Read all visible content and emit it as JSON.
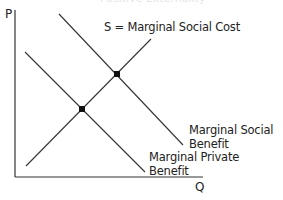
{
  "diagram": {
    "title_faint": "Positive Externality",
    "axes": {
      "y_label": "P",
      "x_label": "Q"
    },
    "curves": [
      {
        "id": "msc",
        "label": "S = Marginal Social Cost",
        "x1": 26,
        "y1": 166,
        "x2": 151,
        "y2": 39
      },
      {
        "id": "msb",
        "label_line1": "Marginal Social",
        "label_line2": "Benefit",
        "x1": 59,
        "y1": 14,
        "x2": 183,
        "y2": 145
      },
      {
        "id": "mpb",
        "label_line1": "Marginal Private",
        "label_line2": "Benefit",
        "x1": 25,
        "y1": 52,
        "x2": 145,
        "y2": 172
      }
    ],
    "equilibria": [
      {
        "id": "social-optimum",
        "x": 117,
        "y": 74
      },
      {
        "id": "market-equilibrium",
        "x": 82,
        "y": 109
      }
    ],
    "colors": {
      "line": "#333333",
      "dot": "#111111",
      "text": "#222222"
    }
  }
}
